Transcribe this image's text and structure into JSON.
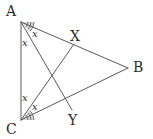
{
  "figure": {
    "kind": "geometry-diagram",
    "background_color": "#ffffff",
    "stroke_color": "#5a5a5a",
    "text_color": "#2b2b2b",
    "sector_fill_color": "#b8b8b8",
    "stroke_width": 1
  },
  "vertices": [
    {
      "name": "A",
      "label": "A",
      "x": 21,
      "y": 22,
      "label_x": 6,
      "label_y": 4
    },
    {
      "name": "B",
      "label": "B",
      "x": 128,
      "y": 68,
      "label_x": 133,
      "label_y": 60
    },
    {
      "name": "C",
      "label": "C",
      "x": 21,
      "y": 120,
      "label_x": 6,
      "label_y": 122
    },
    {
      "name": "X",
      "label": "X",
      "x": 74,
      "y": 44,
      "label_x": 70,
      "label_y": 29
    },
    {
      "name": "Y",
      "label": "Y",
      "x": 72,
      "y": 110,
      "label_x": 68,
      "label_y": 113
    }
  ],
  "segments": [
    {
      "name": "side-AB",
      "from": "A",
      "to": "B"
    },
    {
      "name": "side-BC",
      "from": "B",
      "to": "C"
    },
    {
      "name": "side-AC",
      "from": "A",
      "to": "C"
    },
    {
      "name": "cevian-AY",
      "from": "A",
      "to": "Y"
    },
    {
      "name": "cevian-CX",
      "from": "C",
      "to": "X"
    }
  ],
  "angle_labels": [
    {
      "name": "angle-a-upper",
      "text": "x",
      "x": 32,
      "y": 29
    },
    {
      "name": "angle-a-lower",
      "text": "x",
      "x": 22,
      "y": 38
    },
    {
      "name": "angle-c-upper",
      "text": "x",
      "x": 22,
      "y": 93
    },
    {
      "name": "angle-c-lower",
      "text": "x",
      "x": 32,
      "y": 102
    }
  ],
  "angle_sectors": [
    {
      "name": "sector-at-A",
      "vertex": "A",
      "radius": 13,
      "start_deg": 0,
      "end_deg": 46,
      "arcs": [
        7,
        10,
        13
      ]
    },
    {
      "name": "sector-at-C",
      "vertex": "C",
      "radius": 13,
      "start_deg": -47,
      "end_deg": 0,
      "arcs": [
        7,
        10,
        13
      ]
    }
  ]
}
